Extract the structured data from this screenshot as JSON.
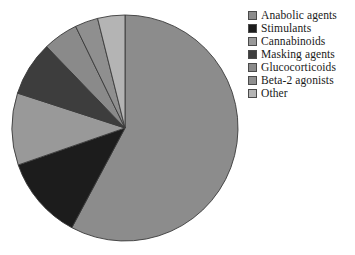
{
  "chart_data": {
    "type": "pie",
    "title": "",
    "subtitle": "",
    "xlabel": "",
    "ylabel": "",
    "legend_position": "right",
    "grid": false,
    "start_angle_deg": 90,
    "direction": "clockwise",
    "categories": [
      "Anabolic agents",
      "Stimulants",
      "Cannabinoids",
      "Masking agents",
      "Glucocorticoids",
      "Beta-2 agonists",
      "Other"
    ],
    "values": [
      57.8,
      11.9,
      10.3,
      7.8,
      5.0,
      3.3,
      3.9
    ],
    "unit": "percent",
    "colors": [
      "#8c8c8c",
      "#1c1c1c",
      "#999999",
      "#3d3d3d",
      "#8a8a8a",
      "#8f8f8f",
      "#b4b4b4"
    ],
    "slice_edge_color": "#3a3a3a"
  },
  "legend": {
    "items": [
      {
        "label": "Anabolic agents",
        "color": "#8c8c8c"
      },
      {
        "label": "Stimulants",
        "color": "#1c1c1c"
      },
      {
        "label": "Cannabinoids",
        "color": "#999999"
      },
      {
        "label": "Masking agents",
        "color": "#3d3d3d"
      },
      {
        "label": "Glucocorticoids",
        "color": "#8a8a8a"
      },
      {
        "label": "Beta-2 agonists",
        "color": "#8f8f8f"
      },
      {
        "label": "Other",
        "color": "#b4b4b4"
      }
    ]
  }
}
